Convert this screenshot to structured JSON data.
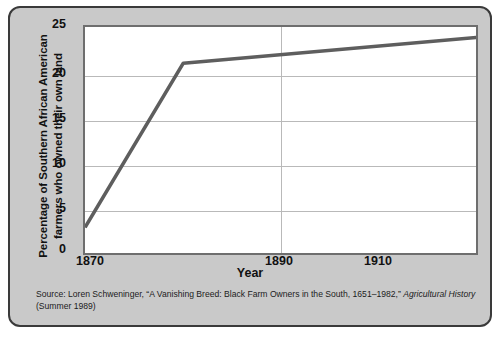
{
  "figure": {
    "frame_bg": "#c9c9c9",
    "plot_bg": "#ffffff",
    "line_color": "#5e5e5e",
    "grid_color": "#b9b9b9",
    "axis_color": "#6e6e6e"
  },
  "axis": {
    "ylabel_line1": "Percentage of Southern African American",
    "ylabel_line2": "farmers who owned their own land",
    "xlabel": "Year",
    "yticks": [
      "0",
      "5",
      "10",
      "15",
      "20",
      "25"
    ],
    "xticks": [
      "1870",
      "1890",
      "1910"
    ]
  },
  "source": {
    "part1": "Source: Loren Schweninger, “A Vanishing Breed: Black Farm Owners in the South, 1651–1982,” ",
    "journal": "Agricultural History",
    "part2": " (Summer 1989)"
  },
  "chart_data": {
    "type": "line",
    "title": "",
    "xlabel": "Year",
    "ylabel": "Percentage of Southern African American farmers who owned their own land",
    "xlim": [
      1870,
      1950
    ],
    "ylim": [
      0,
      25
    ],
    "xticks": [
      1870,
      1890,
      1910
    ],
    "yticks": [
      0,
      5,
      10,
      15,
      20,
      25
    ],
    "grid": "horizontal gridlines at every y tick; single vertical gridline at 1890",
    "legend": "none",
    "series": [
      {
        "name": "Percentage of Southern African American farmers who owned their own land",
        "color": "#5e5e5e",
        "x": [
          1870,
          1890,
          1950
        ],
        "values": [
          2,
          21,
          24
        ]
      }
    ]
  }
}
